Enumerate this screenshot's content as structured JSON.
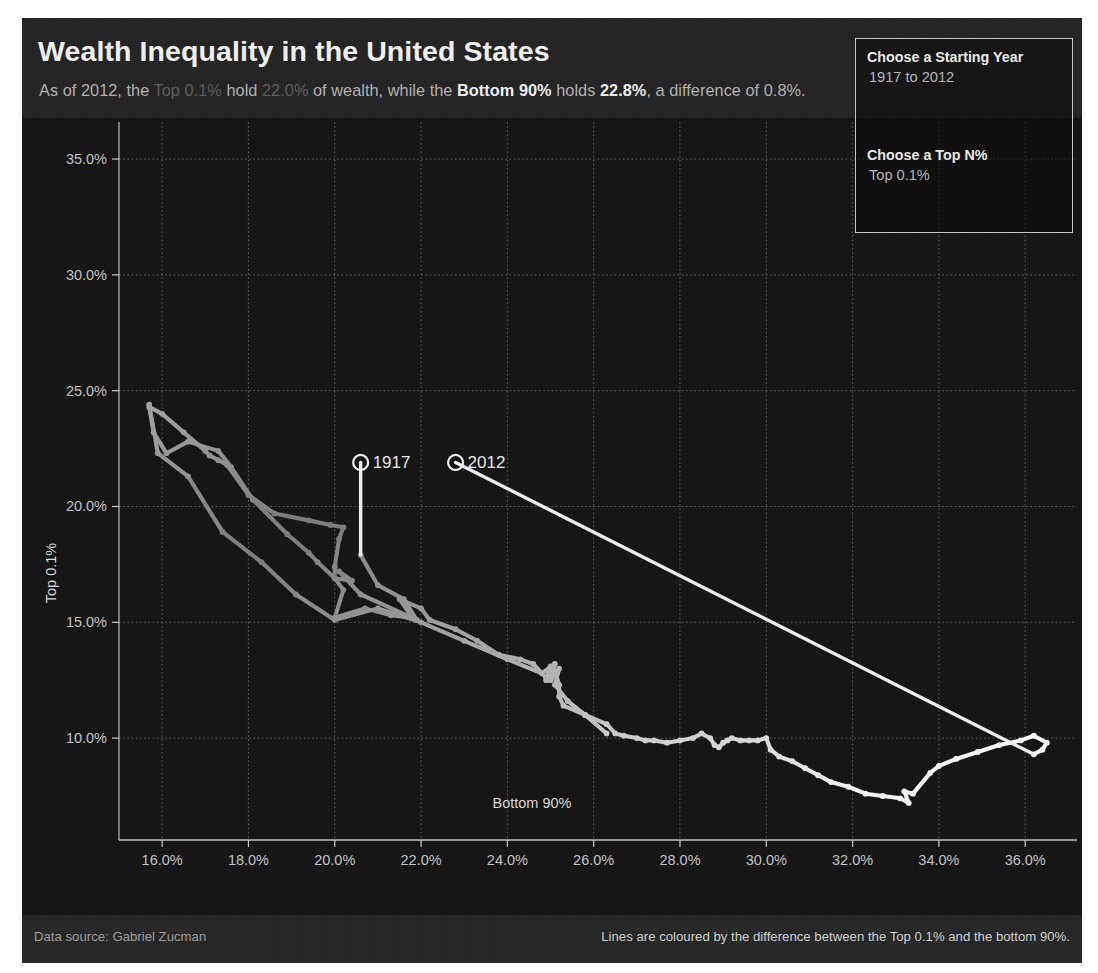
{
  "header": {
    "title": "Wealth Inequality in the United States",
    "subtitle_parts": [
      {
        "text": "As of 2012, the ",
        "style": "normal"
      },
      {
        "text": "Top 0.1%",
        "style": "dim"
      },
      {
        "text": " hold ",
        "style": "normal"
      },
      {
        "text": "22.0%",
        "style": "dim"
      },
      {
        "text": " of wealth, while the ",
        "style": "normal"
      },
      {
        "text": "Bottom 90%",
        "style": "bold"
      },
      {
        "text": " holds ",
        "style": "normal"
      },
      {
        "text": "22.8%",
        "style": "bold"
      },
      {
        "text": ", a difference of 0.8%.",
        "style": "normal"
      }
    ]
  },
  "controls": {
    "year_label": "Choose a Starting Year",
    "year_value": "1917 to 2012",
    "topn_label": "Choose a Top N%",
    "topn_value": "Top 0.1%"
  },
  "footer": {
    "left": "Data source: Gabriel Zucman",
    "right": "Lines are coloured by the difference between the Top 0.1% and the bottom 90%."
  },
  "colors": {
    "background": "#1a1a1a",
    "plot_background": "#141414",
    "header_background": "#232323",
    "footer_background": "#262626",
    "gridline": "#6e6e6e",
    "axis": "#cfcfcf",
    "line_low": "#8d8d8d",
    "line_high": "#ffffff",
    "text_primary": "#f2f2f2",
    "text_secondary": "#b3b3b3",
    "text_dim": "#5d5d5d"
  },
  "chart_data": {
    "type": "line",
    "title": "Wealth Inequality in the United States",
    "xlabel": "Bottom 90%",
    "ylabel": "Top 0.1%",
    "xlim": [
      15.0,
      37.2
    ],
    "ylim": [
      5.6,
      36.6
    ],
    "xticks": [
      "16.0%",
      "18.0%",
      "20.0%",
      "22.0%",
      "24.0%",
      "26.0%",
      "28.0%",
      "30.0%",
      "32.0%",
      "34.0%",
      "36.0%"
    ],
    "xtick_values": [
      16,
      18,
      20,
      22,
      24,
      26,
      28,
      30,
      32,
      34,
      36
    ],
    "yticks": [
      "10.0%",
      "15.0%",
      "20.0%",
      "25.0%",
      "30.0%",
      "35.0%"
    ],
    "ytick_values": [
      10,
      15,
      20,
      25,
      30,
      35
    ],
    "grid": true,
    "legend_position": "none",
    "color_encoding": "difference between Top 0.1% and Bottom 90%",
    "annotations": [
      {
        "label": "1917",
        "x": 20.6,
        "y": 21.9,
        "marker": "open-circle"
      },
      {
        "label": "2012",
        "x": 22.8,
        "y": 21.9,
        "marker": "open-circle"
      }
    ],
    "series": [
      {
        "name": "Top 0.1% vs Bottom 90% (1917-2012)",
        "points": [
          {
            "year": 1917,
            "x": 20.6,
            "y": 17.9,
            "diff": 2.7
          },
          {
            "year": 1918,
            "x": 21.0,
            "y": 16.6,
            "diff": 4.4
          },
          {
            "year": 1919,
            "x": 21.6,
            "y": 16.0,
            "diff": 5.6
          },
          {
            "year": 1920,
            "x": 21.9,
            "y": 15.1,
            "diff": 6.8
          },
          {
            "year": 1921,
            "x": 20.6,
            "y": 16.2,
            "diff": 4.4
          },
          {
            "year": 1922,
            "x": 20.1,
            "y": 17.2,
            "diff": 2.9
          },
          {
            "year": 1923,
            "x": 20.4,
            "y": 16.8,
            "diff": 3.6
          },
          {
            "year": 1924,
            "x": 20.0,
            "y": 16.9,
            "diff": 3.1
          },
          {
            "year": 1925,
            "x": 19.6,
            "y": 17.6,
            "diff": 2.0
          },
          {
            "year": 1926,
            "x": 19.4,
            "y": 18.0,
            "diff": 1.4
          },
          {
            "year": 1927,
            "x": 18.9,
            "y": 18.8,
            "diff": 0.1
          },
          {
            "year": 1928,
            "x": 18.1,
            "y": 20.3,
            "diff": 2.2
          },
          {
            "year": 1929,
            "x": 17.6,
            "y": 21.7,
            "diff": 4.1
          },
          {
            "year": 1930,
            "x": 17.3,
            "y": 22.4,
            "diff": 5.1
          },
          {
            "year": 1931,
            "x": 16.6,
            "y": 22.8,
            "diff": 6.2
          },
          {
            "year": 1932,
            "x": 16.1,
            "y": 22.3,
            "diff": 6.2
          },
          {
            "year": 1933,
            "x": 15.8,
            "y": 23.2,
            "diff": 7.4
          },
          {
            "year": 1934,
            "x": 15.7,
            "y": 24.3,
            "diff": 8.6
          },
          {
            "year": 1935,
            "x": 16.0,
            "y": 24.0,
            "diff": 8.0
          },
          {
            "year": 1936,
            "x": 16.5,
            "y": 23.2,
            "diff": 6.7
          },
          {
            "year": 1937,
            "x": 17.0,
            "y": 22.4,
            "diff": 5.4
          },
          {
            "year": 1938,
            "x": 17.1,
            "y": 22.2,
            "diff": 5.1
          },
          {
            "year": 1939,
            "x": 17.3,
            "y": 22.0,
            "diff": 4.7
          },
          {
            "year": 1940,
            "x": 17.5,
            "y": 21.8,
            "diff": 4.3
          },
          {
            "year": 1941,
            "x": 18.0,
            "y": 20.5,
            "diff": 2.5
          },
          {
            "year": 1942,
            "x": 18.6,
            "y": 19.7,
            "diff": 1.1
          },
          {
            "year": 1943,
            "x": 19.4,
            "y": 19.4,
            "diff": 0.0
          },
          {
            "year": 1944,
            "x": 19.9,
            "y": 19.2,
            "diff": 0.7
          },
          {
            "year": 1945,
            "x": 20.2,
            "y": 19.1,
            "diff": 1.1
          },
          {
            "year": 1946,
            "x": 20.1,
            "y": 18.6,
            "diff": 1.5
          },
          {
            "year": 1947,
            "x": 20.0,
            "y": 17.4,
            "diff": 2.6
          },
          {
            "year": 1948,
            "x": 20.0,
            "y": 16.9,
            "diff": 3.1
          },
          {
            "year": 1949,
            "x": 20.2,
            "y": 16.4,
            "diff": 3.8
          },
          {
            "year": 1950,
            "x": 20.0,
            "y": 15.2,
            "diff": 4.8
          },
          {
            "year": 1951,
            "x": 20.7,
            "y": 15.6,
            "diff": 5.1
          },
          {
            "year": 1952,
            "x": 21.3,
            "y": 15.3,
            "diff": 6.0
          },
          {
            "year": 1953,
            "x": 21.8,
            "y": 15.2,
            "diff": 6.6
          },
          {
            "year": 1954,
            "x": 21.5,
            "y": 16.0,
            "diff": 5.5
          },
          {
            "year": 1955,
            "x": 22.0,
            "y": 15.6,
            "diff": 6.4
          },
          {
            "year": 1956,
            "x": 22.2,
            "y": 15.1,
            "diff": 7.1
          },
          {
            "year": 1957,
            "x": 22.8,
            "y": 14.7,
            "diff": 8.1
          },
          {
            "year": 1958,
            "x": 23.3,
            "y": 14.2,
            "diff": 9.1
          },
          {
            "year": 1959,
            "x": 23.8,
            "y": 13.6,
            "diff": 10.2
          },
          {
            "year": 1960,
            "x": 24.3,
            "y": 13.4,
            "diff": 10.9
          },
          {
            "year": 1961,
            "x": 24.6,
            "y": 13.2,
            "diff": 11.4
          },
          {
            "year": 1962,
            "x": 24.9,
            "y": 12.6,
            "diff": 12.3
          },
          {
            "year": 1963,
            "x": 25.0,
            "y": 13.1,
            "diff": 11.9
          },
          {
            "year": 1964,
            "x": 24.9,
            "y": 12.5,
            "diff": 12.4
          },
          {
            "year": 1965,
            "x": 25.1,
            "y": 12.9,
            "diff": 12.2
          },
          {
            "year": 1966,
            "x": 25.2,
            "y": 12.3,
            "diff": 12.9
          },
          {
            "year": 1967,
            "x": 25.2,
            "y": 11.8,
            "diff": 13.4
          },
          {
            "year": 1968,
            "x": 25.3,
            "y": 11.4,
            "diff": 13.9
          },
          {
            "year": 1969,
            "x": 25.8,
            "y": 11.0,
            "diff": 14.8
          },
          {
            "year": 1970,
            "x": 26.3,
            "y": 10.6,
            "diff": 15.7
          },
          {
            "year": 1971,
            "x": 26.5,
            "y": 10.2,
            "diff": 16.3
          },
          {
            "year": 1972,
            "x": 26.7,
            "y": 10.1,
            "diff": 16.6
          },
          {
            "year": 1973,
            "x": 27.0,
            "y": 10.0,
            "diff": 17.0
          },
          {
            "year": 1974,
            "x": 27.2,
            "y": 9.9,
            "diff": 17.3
          },
          {
            "year": 1975,
            "x": 27.4,
            "y": 9.9,
            "diff": 17.5
          },
          {
            "year": 1976,
            "x": 27.7,
            "y": 9.8,
            "diff": 17.9
          },
          {
            "year": 1977,
            "x": 28.0,
            "y": 9.9,
            "diff": 18.1
          },
          {
            "year": 1978,
            "x": 28.3,
            "y": 10.0,
            "diff": 18.3
          },
          {
            "year": 1979,
            "x": 28.5,
            "y": 10.2,
            "diff": 18.3
          },
          {
            "year": 1980,
            "x": 28.7,
            "y": 10.0,
            "diff": 18.7
          },
          {
            "year": 1981,
            "x": 28.8,
            "y": 9.7,
            "diff": 19.1
          },
          {
            "year": 1982,
            "x": 28.9,
            "y": 9.6,
            "diff": 19.3
          },
          {
            "year": 1983,
            "x": 29.0,
            "y": 9.8,
            "diff": 19.2
          },
          {
            "year": 1984,
            "x": 29.1,
            "y": 9.9,
            "diff": 19.2
          },
          {
            "year": 1985,
            "x": 29.2,
            "y": 10.0,
            "diff": 19.2
          },
          {
            "year": 1986,
            "x": 29.4,
            "y": 9.9,
            "diff": 19.5
          },
          {
            "year": 1987,
            "x": 29.6,
            "y": 9.9,
            "diff": 19.7
          },
          {
            "year": 1988,
            "x": 29.8,
            "y": 9.9,
            "diff": 19.9
          },
          {
            "year": 1989,
            "x": 30.0,
            "y": 10.0,
            "diff": 20.0
          },
          {
            "year": 1990,
            "x": 30.1,
            "y": 9.5,
            "diff": 20.6
          },
          {
            "year": 1991,
            "x": 30.3,
            "y": 9.2,
            "diff": 21.1
          },
          {
            "year": 1992,
            "x": 30.6,
            "y": 9.0,
            "diff": 21.6
          },
          {
            "year": 1993,
            "x": 30.9,
            "y": 8.7,
            "diff": 22.2
          },
          {
            "year": 1994,
            "x": 31.2,
            "y": 8.4,
            "diff": 22.8
          },
          {
            "year": 1995,
            "x": 31.5,
            "y": 8.1,
            "diff": 23.4
          },
          {
            "year": 1996,
            "x": 31.9,
            "y": 7.9,
            "diff": 24.0
          },
          {
            "year": 1997,
            "x": 32.3,
            "y": 7.6,
            "diff": 24.7
          },
          {
            "year": 1998,
            "x": 32.7,
            "y": 7.5,
            "diff": 25.2
          },
          {
            "year": 1999,
            "x": 33.1,
            "y": 7.4,
            "diff": 25.7
          },
          {
            "year": 2000,
            "x": 33.3,
            "y": 7.2,
            "diff": 26.1
          },
          {
            "year": 2001,
            "x": 33.2,
            "y": 7.7,
            "diff": 25.5
          },
          {
            "year": 2002,
            "x": 33.4,
            "y": 7.6,
            "diff": 25.8
          },
          {
            "year": 2003,
            "x": 33.8,
            "y": 8.5,
            "diff": 25.3
          },
          {
            "year": 2004,
            "x": 34.0,
            "y": 8.8,
            "diff": 25.2
          },
          {
            "year": 2005,
            "x": 34.4,
            "y": 9.1,
            "diff": 25.3
          },
          {
            "year": 2006,
            "x": 34.9,
            "y": 9.4,
            "diff": 25.5
          },
          {
            "year": 2007,
            "x": 35.4,
            "y": 9.7,
            "diff": 25.7
          },
          {
            "year": 2008,
            "x": 35.9,
            "y": 9.9,
            "diff": 26.0
          },
          {
            "year": 2009,
            "x": 36.2,
            "y": 10.1,
            "diff": 26.1
          },
          {
            "year": 2010,
            "x": 36.5,
            "y": 9.8,
            "diff": 26.7
          },
          {
            "year": 2011,
            "x": 36.4,
            "y": 9.5,
            "diff": 26.9
          },
          {
            "year": 2012,
            "x": 36.2,
            "y": 9.3,
            "diff": 26.9
          }
        ]
      },
      {
        "name": "descending-branch-1930s-to-1970s",
        "points": [
          {
            "year": 1934,
            "x": 15.7,
            "y": 24.4,
            "diff": 8.7
          },
          {
            "year": 1935,
            "x": 15.9,
            "y": 22.3,
            "diff": 6.4
          },
          {
            "year": 1936,
            "x": 16.6,
            "y": 21.3,
            "diff": 4.7
          },
          {
            "year": 1937,
            "x": 17.4,
            "y": 18.9,
            "diff": 1.5
          },
          {
            "year": 1938,
            "x": 18.3,
            "y": 17.6,
            "diff": 0.7
          },
          {
            "year": 1939,
            "x": 19.1,
            "y": 16.2,
            "diff": 2.9
          },
          {
            "year": 1940,
            "x": 20.0,
            "y": 15.1,
            "diff": 4.9
          },
          {
            "year": 1941,
            "x": 21.0,
            "y": 15.6,
            "diff": 5.4
          },
          {
            "year": 1942,
            "x": 22.0,
            "y": 15.0,
            "diff": 7.0
          },
          {
            "year": 1943,
            "x": 23.0,
            "y": 14.2,
            "diff": 8.8
          },
          {
            "year": 1944,
            "x": 24.0,
            "y": 13.4,
            "diff": 10.6
          },
          {
            "year": 1945,
            "x": 24.8,
            "y": 12.8,
            "diff": 12.0
          },
          {
            "year": 1946,
            "x": 25.1,
            "y": 13.2,
            "diff": 11.9
          },
          {
            "year": 1947,
            "x": 25.0,
            "y": 12.5,
            "diff": 12.5
          },
          {
            "year": 1948,
            "x": 25.2,
            "y": 13.0,
            "diff": 12.2
          },
          {
            "year": 1949,
            "x": 25.1,
            "y": 12.3,
            "diff": 12.8
          },
          {
            "year": 1950,
            "x": 25.4,
            "y": 11.6,
            "diff": 13.8
          },
          {
            "year": 1951,
            "x": 25.8,
            "y": 11.0,
            "diff": 14.8
          },
          {
            "year": 1952,
            "x": 26.3,
            "y": 10.2,
            "diff": 16.1
          }
        ]
      }
    ]
  }
}
